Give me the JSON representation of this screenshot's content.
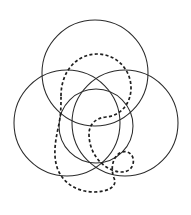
{
  "figure": {
    "background_color": "#ffffff",
    "width": 191,
    "height": 215,
    "solid_stroke_color": "#2b2b2b",
    "solid_stroke_width": 1.05,
    "dashed_stroke_color": "#1f1f1f",
    "dashed_stroke_width": 1.7,
    "dash_pattern": "3.1 2.3",
    "solid_circles": [
      {
        "name": "top-circle",
        "cx": 95,
        "cy": 73,
        "r": 53
      },
      {
        "name": "left-circle",
        "cx": 67,
        "cy": 123,
        "r": 53
      },
      {
        "name": "right-circle",
        "cx": 125,
        "cy": 123,
        "r": 53
      },
      {
        "name": "inner-circle",
        "cx": 96,
        "cy": 126,
        "r": 37
      }
    ],
    "dashed_path": {
      "name": "dashed-knot-curve",
      "closed": true,
      "d": "M 61 96 C 61 71, 77 54, 97 54 C 116 54, 131 69, 131 88 C 131 104, 120 116, 106 117 C 96 118, 89 124, 89 134 C 89 150, 98 164, 112 170 C 122 174, 131 172, 133 164 C 135 156, 129 150, 122 152 C 113 155, 110 168, 114 178 C 118 187, 107 192, 94 192 C 78 192, 64 184, 58 170 C 52 155, 56 138, 59 124 C 61 114, 61 105, 61 96 Z"
    }
  }
}
